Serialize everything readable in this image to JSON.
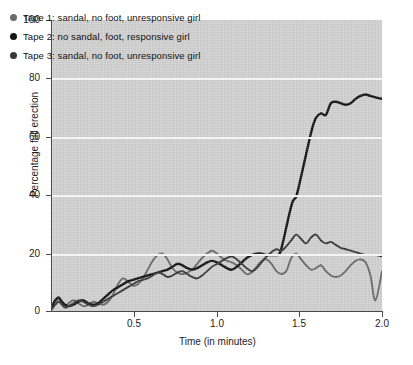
{
  "chart_data": {
    "type": "line",
    "title": "",
    "xlabel": "Time (in minutes)",
    "ylabel": "Percentage full erection",
    "xlim": [
      0,
      2.0
    ],
    "ylim": [
      0,
      100
    ],
    "xticks": [
      "0.5",
      "1.0",
      "1.5",
      "2.0"
    ],
    "xtick_values": [
      0.5,
      1.0,
      1.5,
      2.0
    ],
    "yticks": [
      "0",
      "20",
      "40",
      "60",
      "80",
      "100"
    ],
    "ytick_values": [
      0,
      20,
      40,
      60,
      80,
      100
    ],
    "grid": "horizontal",
    "legend_position": "top-left",
    "plot_background": "#d2d2d2",
    "gridline_color": "#f4f4f4",
    "series": [
      {
        "name": "Tape 1: sandal, no foot, unresponsive girl",
        "color": "#6a6a6a",
        "marker": "circle",
        "x": [
          0.0,
          0.02,
          0.04,
          0.06,
          0.08,
          0.1,
          0.13,
          0.16,
          0.19,
          0.22,
          0.25,
          0.28,
          0.31,
          0.34,
          0.37,
          0.4,
          0.43,
          0.46,
          0.49,
          0.52,
          0.55,
          0.58,
          0.61,
          0.64,
          0.67,
          0.7,
          0.73,
          0.76,
          0.79,
          0.82,
          0.85,
          0.88,
          0.91,
          0.94,
          0.97,
          1.0,
          1.03,
          1.06,
          1.09,
          1.12,
          1.15,
          1.18,
          1.21,
          1.24,
          1.27,
          1.3,
          1.33,
          1.36,
          1.39,
          1.42,
          1.45,
          1.48,
          1.51,
          1.54,
          1.57,
          1.6,
          1.63,
          1.66,
          1.69,
          1.72,
          1.75,
          1.78,
          1.81,
          1.84,
          1.87,
          1.9,
          1.93,
          1.96,
          2.0
        ],
        "y": [
          1.5,
          3.5,
          4.5,
          3.0,
          2.0,
          3.0,
          4.0,
          3.0,
          2.0,
          2.5,
          3.5,
          3.0,
          2.5,
          3.5,
          6.0,
          9.5,
          11.5,
          10.5,
          9.0,
          9.5,
          11.5,
          14.5,
          17.5,
          19.5,
          20.0,
          18.0,
          15.0,
          13.5,
          13.0,
          13.5,
          14.5,
          16.5,
          18.5,
          20.0,
          21.0,
          20.0,
          18.5,
          17.5,
          17.0,
          16.0,
          14.5,
          13.0,
          13.5,
          15.5,
          17.5,
          18.0,
          16.5,
          14.0,
          13.0,
          14.0,
          18.5,
          20.0,
          18.0,
          16.0,
          14.5,
          15.0,
          16.0,
          14.0,
          12.5,
          12.0,
          12.5,
          14.0,
          16.0,
          17.5,
          18.0,
          17.0,
          12.5,
          4.0,
          14.0
        ]
      },
      {
        "name": "Tape 2: no sandal, foot, responsive girl",
        "color": "#151515",
        "marker": "circle",
        "x": [
          0.0,
          0.02,
          0.04,
          0.06,
          0.08,
          0.1,
          0.13,
          0.16,
          0.19,
          0.22,
          0.25,
          0.28,
          0.31,
          0.34,
          0.37,
          0.4,
          0.43,
          0.46,
          0.49,
          0.52,
          0.55,
          0.58,
          0.61,
          0.64,
          0.67,
          0.7,
          0.73,
          0.76,
          0.79,
          0.82,
          0.85,
          0.88,
          0.91,
          0.94,
          0.97,
          1.0,
          1.03,
          1.06,
          1.09,
          1.12,
          1.15,
          1.18,
          1.21,
          1.24,
          1.27,
          1.3,
          1.33,
          1.36,
          1.38,
          1.4,
          1.42,
          1.44,
          1.46,
          1.48,
          1.5,
          1.52,
          1.54,
          1.56,
          1.58,
          1.6,
          1.63,
          1.66,
          1.69,
          1.72,
          1.75,
          1.78,
          1.81,
          1.84,
          1.87,
          1.9,
          1.93,
          1.96,
          2.0
        ],
        "y": [
          2.0,
          4.0,
          5.0,
          3.5,
          2.5,
          2.0,
          2.5,
          3.5,
          4.0,
          3.0,
          2.5,
          3.0,
          4.5,
          6.0,
          7.5,
          8.5,
          9.5,
          10.5,
          11.0,
          11.5,
          12.0,
          12.5,
          13.0,
          13.5,
          14.0,
          14.5,
          15.5,
          16.5,
          16.0,
          15.0,
          14.5,
          15.0,
          16.0,
          17.0,
          17.5,
          17.0,
          16.0,
          15.0,
          14.5,
          15.5,
          17.0,
          18.5,
          19.5,
          20.0,
          20.0,
          19.5,
          19.5,
          19.5,
          20.0,
          24.0,
          29.0,
          34.0,
          38.0,
          39.5,
          44.0,
          49.0,
          54.0,
          59.0,
          63.5,
          66.5,
          68.0,
          67.5,
          71.5,
          72.0,
          71.5,
          71.0,
          71.5,
          73.0,
          74.0,
          74.5,
          74.0,
          73.5,
          73.0
        ]
      },
      {
        "name": "Tape 3: sandal, no foot, unresponsive girl",
        "color": "#383838",
        "marker": "circle",
        "x": [
          0.0,
          0.02,
          0.04,
          0.06,
          0.08,
          0.1,
          0.13,
          0.16,
          0.19,
          0.22,
          0.25,
          0.28,
          0.31,
          0.34,
          0.37,
          0.4,
          0.43,
          0.46,
          0.49,
          0.52,
          0.55,
          0.58,
          0.61,
          0.64,
          0.67,
          0.7,
          0.73,
          0.76,
          0.79,
          0.82,
          0.85,
          0.88,
          0.91,
          0.94,
          0.97,
          1.0,
          1.03,
          1.06,
          1.09,
          1.12,
          1.15,
          1.18,
          1.21,
          1.24,
          1.27,
          1.3,
          1.33,
          1.36,
          1.39,
          1.42,
          1.45,
          1.48,
          1.51,
          1.54,
          1.57,
          1.6,
          1.63,
          1.66,
          1.69,
          1.72,
          1.75,
          1.78,
          1.81,
          1.84,
          1.87,
          1.9,
          1.93,
          1.96,
          2.0
        ],
        "y": [
          1.0,
          2.5,
          3.5,
          2.5,
          1.5,
          2.0,
          3.0,
          4.0,
          3.5,
          2.5,
          2.0,
          2.5,
          3.5,
          4.5,
          5.5,
          6.5,
          7.5,
          8.5,
          9.5,
          10.5,
          11.0,
          11.5,
          12.5,
          13.5,
          13.0,
          12.0,
          12.5,
          13.5,
          14.0,
          13.0,
          12.0,
          11.5,
          12.5,
          14.0,
          15.5,
          16.5,
          17.5,
          18.5,
          19.0,
          18.0,
          16.5,
          15.0,
          14.0,
          15.0,
          17.0,
          19.0,
          20.5,
          21.5,
          21.0,
          22.5,
          24.5,
          26.5,
          25.0,
          23.5,
          25.5,
          26.5,
          24.5,
          23.5,
          24.0,
          23.0,
          22.0,
          21.5,
          21.0,
          20.5,
          20.0,
          19.5,
          19.5,
          19.5,
          19.0
        ]
      }
    ]
  },
  "legend": {
    "items": [
      {
        "label": "Tape 1: sandal, no foot, unresponsive girl",
        "color": "#6a6a6a"
      },
      {
        "label": "Tape 2: no sandal, foot, responsive girl",
        "color": "#151515"
      },
      {
        "label": "Tape 3: sandal, no foot, unresponsive girl",
        "color": "#383838"
      }
    ]
  },
  "axes": {
    "y_title": "Percentage full erection",
    "x_title": "Time (in minutes)",
    "y_ticks": [
      "100",
      "80",
      "60",
      "40",
      "20",
      "0"
    ],
    "x_ticks": [
      "0.5",
      "1.0",
      "1.5",
      "2.0"
    ]
  }
}
